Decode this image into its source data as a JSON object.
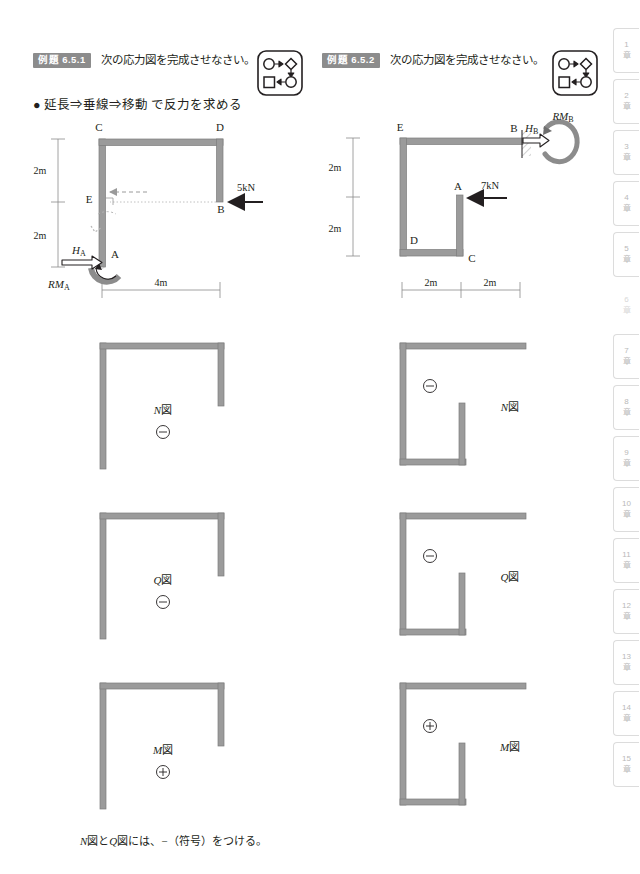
{
  "problems": [
    {
      "badge": "例題 6.5.1",
      "prompt": "次の応力図を完成させなさい。",
      "icon": "flow-diagram-icon",
      "hint": "● 延長⇒垂線⇒移動 で反力を求める",
      "frame": {
        "nodes": [
          "C",
          "D",
          "E",
          "B",
          "A"
        ],
        "load": {
          "label": "5kN",
          "at": "B",
          "direction": "left"
        },
        "reactions": [
          {
            "label": "H",
            "sub": "A",
            "type": "horizontal-force"
          },
          {
            "label": "RM",
            "sub": "A",
            "type": "moment"
          }
        ],
        "dims_vertical": [
          "2m",
          "2m"
        ],
        "dims_horizontal": [
          "4m"
        ],
        "support": {
          "at": "A",
          "type": "fixed"
        }
      },
      "diagrams": [
        {
          "name": "N",
          "label": "N図",
          "sign": "−",
          "sign_glyph": "⊖"
        },
        {
          "name": "Q",
          "label": "Q図",
          "sign": "−",
          "sign_glyph": "⊖"
        },
        {
          "name": "M",
          "label": "M図",
          "sign": "+",
          "sign_glyph": "⊕"
        }
      ]
    },
    {
      "badge": "例題 6.5.2",
      "prompt": "次の応力図を完成させなさい。",
      "icon": "flow-diagram-icon",
      "hint": "",
      "frame": {
        "nodes": [
          "E",
          "B",
          "A",
          "D",
          "C"
        ],
        "load": {
          "label": "7kN",
          "at": "A",
          "direction": "left"
        },
        "reactions": [
          {
            "label": "H",
            "sub": "B",
            "type": "horizontal-force"
          },
          {
            "label": "RM",
            "sub": "B",
            "type": "moment"
          }
        ],
        "dims_vertical": [
          "2m",
          "2m"
        ],
        "dims_horizontal": [
          "2m",
          "2m"
        ],
        "support": {
          "at": "B",
          "type": "fixed-wall"
        }
      },
      "diagrams": [
        {
          "name": "N",
          "label": "N図",
          "sign": "−",
          "sign_glyph": "⊖"
        },
        {
          "name": "Q",
          "label": "Q図",
          "sign": "−",
          "sign_glyph": "⊖"
        },
        {
          "name": "M",
          "label": "M図",
          "sign": "+",
          "sign_glyph": "⊕"
        }
      ]
    }
  ],
  "footnote": "N図とQ図には、−（符号）をつける。",
  "footnote_parts": {
    "a": "N",
    "b": "図と",
    "c": "Q",
    "d": "図には、−（符号）をつける。"
  },
  "sidebar": {
    "tabs": [
      {
        "num": "1",
        "unit": "章",
        "active": false
      },
      {
        "num": "2",
        "unit": "章",
        "active": false
      },
      {
        "num": "3",
        "unit": "章",
        "active": false
      },
      {
        "num": "4",
        "unit": "章",
        "active": false
      },
      {
        "num": "5",
        "unit": "章",
        "active": false
      },
      {
        "num": "6",
        "unit": "章",
        "active": true
      },
      {
        "num": "7",
        "unit": "章",
        "active": false
      },
      {
        "num": "8",
        "unit": "章",
        "active": false
      },
      {
        "num": "9",
        "unit": "章",
        "active": false
      },
      {
        "num": "10",
        "unit": "章",
        "active": false
      },
      {
        "num": "11",
        "unit": "章",
        "active": false
      },
      {
        "num": "12",
        "unit": "章",
        "active": false
      },
      {
        "num": "13",
        "unit": "章",
        "active": false
      },
      {
        "num": "14",
        "unit": "章",
        "active": false
      },
      {
        "num": "15",
        "unit": "章",
        "active": false
      }
    ]
  },
  "colors": {
    "member": "#9b9b9b",
    "member_edge": "#7d7d7d",
    "ink": "#231f20",
    "dim": "#8a8a8a",
    "badge_bg": "#8c8c8c",
    "tab_border": "#dcdcdc",
    "tab_text": "#b9b9b9"
  }
}
